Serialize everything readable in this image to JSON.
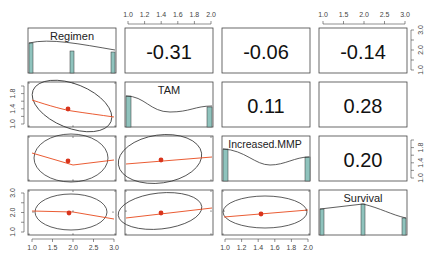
{
  "chart_data": {
    "type": "pairs",
    "title": "",
    "variables": [
      "Regimen",
      "TAM",
      "Increased.MMP",
      "Survival"
    ],
    "axis_ticks": {
      "Regimen": [
        "1.0",
        "1.5",
        "2.0",
        "2.5",
        "3.0"
      ],
      "TAM": [
        "1.0",
        "1.2",
        "1.4",
        "1.6",
        "1.8",
        "2.0"
      ],
      "Increased.MMP": [
        "1.0",
        "1.2",
        "1.4",
        "1.6",
        "1.8",
        "2.0"
      ],
      "Survival": [
        "1.0",
        "2.0",
        "3.0"
      ]
    },
    "axis_tick_labels_vertical": {
      "TAM": [
        "1.0",
        "1.4",
        "1.8"
      ],
      "Increased.MMP": [
        "1.0",
        "1.4",
        "1.8"
      ],
      "Survival_left": [
        "1.0",
        "2.0",
        "3.0"
      ],
      "Regimen_right": [
        "1.0",
        "2.0",
        "3.0"
      ]
    },
    "correlations": [
      {
        "x": "Regimen",
        "y": "TAM",
        "r": "-0.31"
      },
      {
        "x": "Regimen",
        "y": "Increased.MMP",
        "r": "-0.06"
      },
      {
        "x": "Regimen",
        "y": "Survival",
        "r": "-0.14"
      },
      {
        "x": "TAM",
        "y": "Increased.MMP",
        "r": "0.11"
      },
      {
        "x": "TAM",
        "y": "Survival",
        "r": "0.28"
      },
      {
        "x": "Increased.MMP",
        "y": "Survival",
        "r": "0.20"
      }
    ],
    "histograms": {
      "Regimen": {
        "bins": [
          1,
          2,
          3
        ],
        "relative_heights": [
          0.7,
          0.55,
          0.5
        ]
      },
      "TAM": {
        "bins": [
          1,
          2
        ],
        "relative_heights": [
          0.85,
          0.55
        ]
      },
      "Increased.MMP": {
        "bins": [
          1,
          2
        ],
        "relative_heights": [
          0.9,
          0.7
        ]
      },
      "Survival": {
        "bins": [
          1,
          2,
          3
        ],
        "relative_heights": [
          0.65,
          0.85,
          0.35
        ]
      }
    },
    "scatter_means": [
      {
        "x": "Regimen",
        "y": "TAM",
        "mean_x": 1.9,
        "mean_y": 1.36
      },
      {
        "x": "Regimen",
        "y": "Increased.MMP",
        "mean_x": 1.9,
        "mean_y": 1.45
      },
      {
        "x": "TAM",
        "y": "Increased.MMP",
        "mean_x": 1.42,
        "mean_y": 1.45
      },
      {
        "x": "Regimen",
        "y": "Survival",
        "mean_x": 1.9,
        "mean_y": 1.85
      },
      {
        "x": "TAM",
        "y": "Survival",
        "mean_x": 1.42,
        "mean_y": 1.85
      },
      {
        "x": "Increased.MMP",
        "y": "Survival",
        "mean_x": 1.45,
        "mean_y": 1.85
      }
    ],
    "colors": {
      "histogram_fill": "#8fc3bd",
      "loess_line": "#e8491d",
      "mean_point": "#d9341c",
      "ellipse": "#333333",
      "panel_border": "#444444"
    },
    "legend": null,
    "grid": false
  }
}
